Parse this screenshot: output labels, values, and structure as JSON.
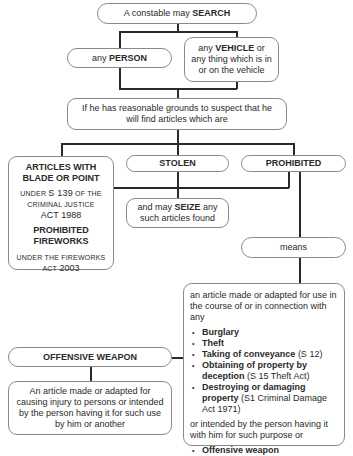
{
  "nodes": {
    "search": {
      "pre": "A constable may ",
      "bold": "SEARCH"
    },
    "person": {
      "pre": "any ",
      "bold": "PERSON"
    },
    "vehicle": {
      "pre": "any ",
      "bold": "VEHICLE",
      "post": " or",
      "line2": "any thing which is in",
      "line3": "or on the vehicle"
    },
    "grounds": {
      "line1": "If he has reasonable grounds to suspect that he",
      "line2": "will find articles which are"
    },
    "blade": {
      "title1": "ARTICLES WITH",
      "title2": "BLADE OR POINT",
      "ref1_a": "UNDER ",
      "ref1_b": "S 139",
      "ref1_c": " OF THE",
      "ref1_line2": "CRIMINAL JUSTICE",
      "ref1_line3_a": "ACT",
      "ref1_line3_b": " 1988",
      "title3": "PROHIBITED",
      "title4": "FIREWORKS",
      "ref2_line1": "UNDER THE FIREWORKS",
      "ref2_line2_a": "ACT",
      "ref2_line2_b": " 2003"
    },
    "stolen": {
      "label": "STOLEN"
    },
    "prohibited": {
      "label": "PROHIBITED"
    },
    "seize": {
      "pre": "and may ",
      "bold": "SEIZE",
      "post": " any",
      "line2": "such articles found"
    },
    "means": {
      "label": "means"
    },
    "definition": {
      "intro": "an article made or adapted for use in the course of or in connection with any",
      "items": [
        {
          "bold": "Burglary",
          "rest": ""
        },
        {
          "bold": "Theft",
          "rest": ""
        },
        {
          "bold": "Taking of conveyance",
          "rest": " (S 12)"
        },
        {
          "bold": "Obtaining of property by deception",
          "rest": " (S 15 Theft Act)"
        },
        {
          "bold": "Destroying or damaging property",
          "rest": " (S1 Criminal Damage Act 1971)"
        }
      ],
      "middle": "or intended by the person having it with him for such purpose or",
      "last_item": {
        "bold": "Offensive weapon"
      }
    },
    "offensive": {
      "label": "OFFENSIVE WEAPON"
    },
    "offensive_def": {
      "text": "An article made or adapted for causing injury to persons or intended by the person having it for such use by him or another"
    }
  }
}
